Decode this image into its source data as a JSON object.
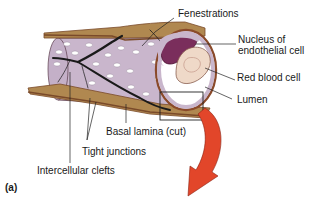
{
  "figure": {
    "panel_label": "(a)"
  },
  "labels": {
    "fenestrations": "Fenestrations",
    "nucleus_line1": "Nucleus of",
    "nucleus_line2": "endothelial cell",
    "red_blood_cell": "Red blood cell",
    "lumen": "Lumen",
    "basal_lamina": "Basal lamina (cut)",
    "tight_junctions": "Tight junctions",
    "intercellular_clefts": "Intercellular clefts"
  },
  "colors": {
    "endothelium": "#c9b6cc",
    "basal_lamina": "#b08850",
    "basal_lamina_dark": "#7a4a2a",
    "nucleus": "#7a2e5c",
    "red_blood_cell": "#efd9c8",
    "arrow": "#e2462a",
    "clefts": "#1a1a1a",
    "fenestration": "#ffffff"
  }
}
